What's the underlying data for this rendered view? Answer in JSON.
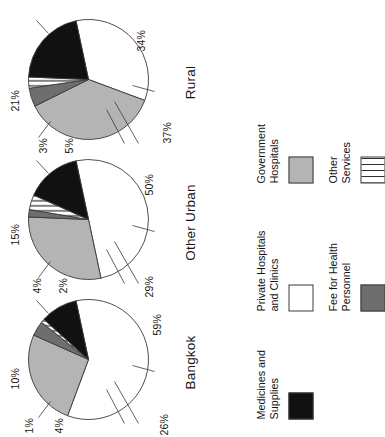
{
  "figure": {
    "orientation_deg": -90,
    "background": "#ffffff"
  },
  "legend": {
    "position": "below-charts",
    "items": [
      {
        "label_line1": "Medicines and",
        "label_line2": "Supplies",
        "key": "medicines",
        "swatch": "black",
        "color": "#111111"
      },
      {
        "label_line1": "Private Hospitals",
        "label_line2": "and Clinics",
        "key": "private",
        "swatch": "white",
        "color": "#ffffff"
      },
      {
        "label_line1": "Government",
        "label_line2": "Hospitals",
        "key": "government",
        "swatch": "light-grey",
        "color": "#b4b4b4"
      },
      {
        "label_line1": "Fee for Health",
        "label_line2": "Personnel",
        "key": "fee",
        "swatch": "dark-grey",
        "color": "#6e6e6e"
      },
      {
        "label_line1": "Other",
        "label_line2": "Services",
        "key": "other",
        "swatch": "striped",
        "color": "#ffffff"
      }
    ]
  },
  "chart_data": [
    {
      "type": "pie",
      "title": "Bangkok",
      "categories": [
        "Private Hospitals and Clinics",
        "Government Hospitals",
        "Fee for Health Personnel",
        "Other Services",
        "Medicines and Supplies"
      ],
      "keys": [
        "private",
        "government",
        "fee",
        "other",
        "medicines"
      ],
      "values": [
        59,
        26,
        4,
        1,
        10
      ],
      "labels": [
        "59%",
        "26%",
        "4%",
        "1%",
        "10%"
      ],
      "colors": [
        "#ffffff",
        "#b4b4b4",
        "#6e6e6e",
        "#ffffff",
        "#111111"
      ],
      "patterns": [
        "solid",
        "solid",
        "solid",
        "vertical-stripes",
        "solid"
      ]
    },
    {
      "type": "pie",
      "title": "Other Urban",
      "categories": [
        "Private Hospitals and Clinics",
        "Government Hospitals",
        "Fee for Health Personnel",
        "Other Services",
        "Medicines and Supplies"
      ],
      "keys": [
        "private",
        "government",
        "fee",
        "other",
        "medicines"
      ],
      "values": [
        50,
        29,
        2,
        4,
        15
      ],
      "labels": [
        "50%",
        "29%",
        "2%",
        "4%",
        "15%"
      ],
      "colors": [
        "#ffffff",
        "#b4b4b4",
        "#6e6e6e",
        "#ffffff",
        "#111111"
      ],
      "patterns": [
        "solid",
        "solid",
        "solid",
        "vertical-stripes",
        "solid"
      ]
    },
    {
      "type": "pie",
      "title": "Rural",
      "categories": [
        "Private Hospitals and Clinics",
        "Government Hospitals",
        "Fee for Health Personnel",
        "Other Services",
        "Medicines and Supplies"
      ],
      "keys": [
        "private",
        "government",
        "fee",
        "other",
        "medicines"
      ],
      "values": [
        34,
        37,
        5,
        3,
        21
      ],
      "labels": [
        "34%",
        "37%",
        "5%",
        "3%",
        "21%"
      ],
      "colors": [
        "#ffffff",
        "#b4b4b4",
        "#6e6e6e",
        "#ffffff",
        "#111111"
      ],
      "patterns": [
        "solid",
        "solid",
        "solid",
        "vertical-stripes",
        "solid"
      ]
    }
  ]
}
